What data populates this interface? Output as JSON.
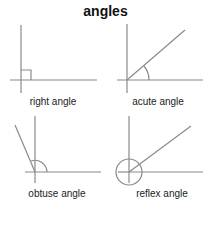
{
  "title": "angles",
  "panels": [
    {
      "id": "right",
      "label": "right angle"
    },
    {
      "id": "acute",
      "label": "acute angle"
    },
    {
      "id": "obtuse",
      "label": "obtuse angle"
    },
    {
      "id": "reflex",
      "label": "reflex angle"
    }
  ],
  "colors": {
    "line": "#8a8a8a",
    "text": "#222222"
  }
}
